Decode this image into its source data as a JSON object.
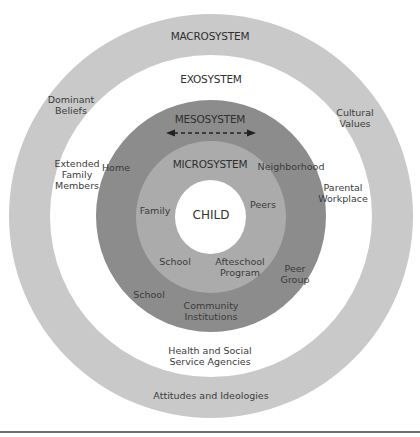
{
  "diagram": {
    "colors": {
      "macrosystem_ring": "#c9c9c9",
      "exosystem_ring": "#ffffff",
      "mesosystem_ring": "#8c8c8c",
      "microsystem_ring": "#ababab",
      "child_circle": "#ffffff"
    },
    "systems": {
      "macrosystem": {
        "label": "MACROSYSTEM",
        "items": [
          "Dominant Beliefs",
          "Cultural Values",
          "Attitudes and Ideologies"
        ]
      },
      "exosystem": {
        "label": "EXOSYSTEM",
        "items": [
          "Extended Family Members",
          "Parental Workplace",
          "Health and Social Service Agencies"
        ]
      },
      "mesosystem": {
        "label": "MESOSYSTEM",
        "items": [
          "Home",
          "Neighborhood",
          "School",
          "Community Institutions",
          "Peer Group"
        ],
        "arrow": "bidirectional-dashed-arrow"
      },
      "microsystem": {
        "label": "MICROSYSTEM",
        "items": [
          "Family",
          "Peers",
          "School",
          "Afteschool Program"
        ]
      },
      "center": {
        "label": "CHILD"
      }
    },
    "text": {
      "macro_title": "MACROSYSTEM",
      "dominant_1": "Dominant",
      "dominant_2": "Beliefs",
      "cultural_1": "Cultural",
      "cultural_2": "Values",
      "attitudes": "Attitudes and Ideologies",
      "exo_title": "EXOSYSTEM",
      "extended_1": "Extended",
      "extended_2": "Family",
      "extended_3": "Members",
      "parental_1": "Parental",
      "parental_2": "Workplace",
      "health_1": "Health and Social",
      "health_2": "Service Agencies",
      "meso_title": "MESOSYSTEM",
      "home": "Home",
      "neighborhood": "Neighborhood",
      "school_meso": "School",
      "community_1": "Community",
      "community_2": "Institutions",
      "peer_1": "Peer",
      "peer_2": "Group",
      "micro_title": "MICROSYSTEM",
      "family": "Family",
      "peers": "Peers",
      "school_micro": "School",
      "afterschool_1": "Afteschool",
      "afterschool_2": "Program",
      "child": "CHILD"
    }
  }
}
